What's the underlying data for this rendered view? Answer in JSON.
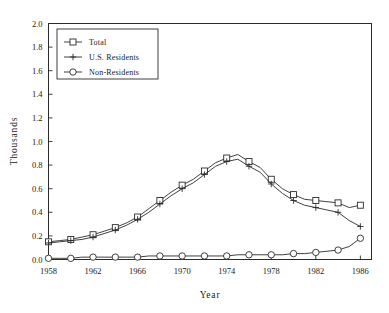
{
  "chart_data": {
    "type": "line",
    "title": "",
    "xlabel": "Year",
    "ylabel": "Thousands",
    "xlim": [
      1958,
      1987
    ],
    "ylim": [
      0.0,
      2.0
    ],
    "grid": false,
    "legend_position": "upper-left",
    "x": [
      1958,
      1959,
      1960,
      1961,
      1962,
      1963,
      1964,
      1965,
      1966,
      1967,
      1968,
      1969,
      1970,
      1971,
      1972,
      1973,
      1974,
      1975,
      1976,
      1977,
      1978,
      1979,
      1980,
      1981,
      1982,
      1983,
      1984,
      1985,
      1986
    ],
    "xtick_labels": [
      "1958",
      "1962",
      "1966",
      "1970",
      "1974",
      "1978",
      "1982",
      "1986"
    ],
    "xtick_values": [
      1958,
      1962,
      1966,
      1970,
      1974,
      1978,
      1982,
      1986
    ],
    "ytick_labels": [
      "0.0",
      "0.2",
      "0.4",
      "0.6",
      "0.8",
      "1.0",
      "1.2",
      "1.4",
      "1.6",
      "1.8",
      "2.0"
    ],
    "ytick_values": [
      0.0,
      0.2,
      0.4,
      0.6,
      0.8,
      1.0,
      1.2,
      1.4,
      1.6,
      1.8,
      2.0
    ],
    "series": [
      {
        "name": "Total",
        "marker": "square",
        "values": [
          0.15,
          0.16,
          0.17,
          0.19,
          0.21,
          0.24,
          0.27,
          0.31,
          0.36,
          0.43,
          0.5,
          0.57,
          0.63,
          0.68,
          0.75,
          0.82,
          0.86,
          0.89,
          0.83,
          0.78,
          0.68,
          0.6,
          0.55,
          0.51,
          0.5,
          0.49,
          0.48,
          0.44,
          0.46
        ]
      },
      {
        "name": "U.S. Residents",
        "marker": "plus",
        "values": [
          0.14,
          0.15,
          0.16,
          0.17,
          0.19,
          0.22,
          0.25,
          0.29,
          0.34,
          0.4,
          0.47,
          0.54,
          0.6,
          0.65,
          0.72,
          0.79,
          0.83,
          0.85,
          0.79,
          0.74,
          0.64,
          0.56,
          0.5,
          0.46,
          0.44,
          0.42,
          0.4,
          0.33,
          0.28
        ]
      },
      {
        "name": "Non-Residents",
        "marker": "circle",
        "values": [
          0.01,
          0.01,
          0.01,
          0.02,
          0.02,
          0.02,
          0.02,
          0.02,
          0.02,
          0.03,
          0.03,
          0.03,
          0.03,
          0.03,
          0.03,
          0.03,
          0.03,
          0.04,
          0.04,
          0.04,
          0.04,
          0.04,
          0.05,
          0.05,
          0.06,
          0.07,
          0.08,
          0.11,
          0.18
        ]
      }
    ],
    "marker_years": [
      1958,
      1960,
      1962,
      1964,
      1966,
      1968,
      1970,
      1972,
      1974,
      1976,
      1978,
      1980,
      1982,
      1984,
      1986
    ]
  },
  "legend": {
    "entries": [
      {
        "label": "Total"
      },
      {
        "label": "U.S. Residents"
      },
      {
        "label": "Non-Residents"
      }
    ]
  }
}
